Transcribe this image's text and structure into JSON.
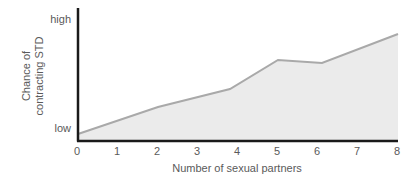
{
  "chart_data": {
    "type": "area",
    "title": "",
    "xlabel": "Number of sexual partners",
    "ylabel": "Chance of contracting STD",
    "ylabel_lines": [
      "Chance of",
      "contracting STD"
    ],
    "x_ticks": [
      "0",
      "1",
      "2",
      "3",
      "4",
      "5",
      "6",
      "7",
      "8"
    ],
    "y_ticks": [
      "low",
      "high"
    ],
    "xlim": [
      0,
      8
    ],
    "ylim": [
      0,
      1
    ],
    "y_scale_note": "qualitative, normalized 0 (low) to 1 (high)",
    "grid": false,
    "legend": null,
    "x": [
      0,
      2,
      3.8,
      5,
      6.1,
      8
    ],
    "values": [
      0.0,
      0.27,
      0.45,
      0.74,
      0.71,
      1.0
    ],
    "colors": {
      "fill": "#ebebeb",
      "line": "#a9a9a9",
      "axis": "#1a1a1a",
      "text": "#5a5a5a"
    }
  }
}
